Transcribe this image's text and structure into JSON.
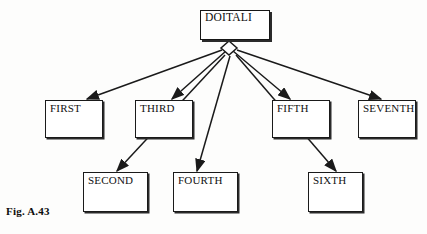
{
  "figure": {
    "caption": "Fig. A.43",
    "caption_x": 6,
    "caption_y": 205
  },
  "colors": {
    "background": "#fdfdfc",
    "line": "#1a1a1a",
    "box_border": "#1a1a1a",
    "box_fill": "#ffffff",
    "text": "#111111",
    "shadow": "#2b2b2b"
  },
  "root": {
    "label": "DOITALI",
    "x": 200,
    "y": 10,
    "w": 70,
    "h": 30
  },
  "junction": {
    "name": "diamond-junction",
    "cx": 229,
    "cy": 48,
    "rx": 8,
    "ry": 7
  },
  "nodes": [
    {
      "label": "FIRST",
      "x": 45,
      "y": 100,
      "w": 58,
      "h": 38
    },
    {
      "label": "THIRD",
      "x": 135,
      "y": 100,
      "w": 58,
      "h": 38
    },
    {
      "label": "FIFTH",
      "x": 272,
      "y": 100,
      "w": 58,
      "h": 38
    },
    {
      "label": "SEVENTH",
      "x": 358,
      "y": 100,
      "w": 58,
      "h": 38
    },
    {
      "label": "SECOND",
      "x": 83,
      "y": 172,
      "w": 65,
      "h": 40
    },
    {
      "label": "FOURTH",
      "x": 173,
      "y": 172,
      "w": 65,
      "h": 40
    },
    {
      "label": "SIXTH",
      "x": 308,
      "y": 172,
      "w": 55,
      "h": 40
    }
  ],
  "connections": [
    {
      "from": "DOITALI",
      "to": "FIRST",
      "x1": 222,
      "y1": 50,
      "x2": 87,
      "y2": 99
    },
    {
      "from": "DOITALI",
      "to": "THIRD",
      "x1": 226,
      "y1": 51,
      "x2": 172,
      "y2": 99
    },
    {
      "from": "DOITALI",
      "to": "FIFTH",
      "x1": 233,
      "y1": 51,
      "x2": 290,
      "y2": 99
    },
    {
      "from": "DOITALI",
      "to": "SEVENTH",
      "x1": 237,
      "y1": 50,
      "x2": 381,
      "y2": 99
    },
    {
      "from": "DOITALI",
      "to": "SECOND",
      "x1": 225,
      "y1": 55,
      "x2": 117,
      "y2": 171
    },
    {
      "from": "DOITALI",
      "to": "FOURTH",
      "x1": 230,
      "y1": 56,
      "x2": 197,
      "y2": 171
    },
    {
      "from": "DOITALI",
      "to": "SIXTH",
      "x1": 236,
      "y1": 55,
      "x2": 336,
      "y2": 171
    }
  ],
  "diagram_meta": {
    "type": "tree-hierarchy",
    "root_count": 1,
    "leaf_count": 7,
    "arrow_count": 7
  }
}
